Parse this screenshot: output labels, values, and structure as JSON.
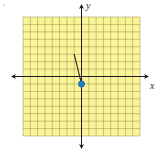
{
  "diagram": {
    "type": "coordinate-plane",
    "grid": {
      "columns": 16,
      "rows": 16,
      "x_range": [
        -8,
        8
      ],
      "y_range": [
        -8,
        8
      ],
      "fill_color": "#fbf59a",
      "line_color": "#8f8a45"
    },
    "axes": {
      "x_label": "x",
      "y_label": "y",
      "color": "#1a1a1a"
    },
    "segment": {
      "from": [
        -1,
        3
      ],
      "to": [
        0,
        -1
      ],
      "color": "#222222"
    },
    "point": {
      "at": [
        0,
        -1
      ],
      "color": "#1f7fc4"
    }
  }
}
